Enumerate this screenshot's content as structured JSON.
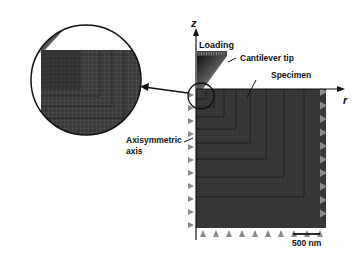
{
  "figure": {
    "labels": {
      "z_axis": "z",
      "r_axis": "r",
      "loading": "Loading",
      "cantilever_tip": "Cantilever tip",
      "specimen": "Specimen",
      "axisymmetric_axis_line1": "Axisymmetric",
      "axisymmetric_axis_line2": "axis",
      "scale_bar": "500 nm"
    },
    "colors": {
      "mesh_dark": "#2a2a2a",
      "mesh_mid": "#4a4a4a",
      "constraint_triangle": "#8a8a8a",
      "line": "#111111"
    },
    "components": [
      "zoom-inset",
      "cantilever-tip",
      "specimen-mesh",
      "boundary-constraints",
      "scale-bar"
    ]
  }
}
